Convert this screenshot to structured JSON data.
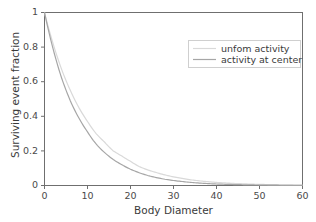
{
  "chart_data": {
    "type": "line",
    "title": "",
    "xlabel": "Body Diameter",
    "ylabel": "Surviving event fraction",
    "xlim": [
      0,
      60
    ],
    "ylim": [
      0,
      1
    ],
    "grid": false,
    "legend_position": "upper right",
    "xticks": [
      0,
      10,
      20,
      30,
      40,
      50,
      60
    ],
    "xtick_labels": [
      "0",
      "10",
      "20",
      "30",
      "40",
      "50",
      "60"
    ],
    "yticks": [
      0,
      0.2,
      0.4,
      0.6,
      0.8,
      1
    ],
    "ytick_labels": [
      "0",
      "0.2",
      "0.4",
      "0.6",
      "0.8",
      "1"
    ],
    "x": [
      0,
      2,
      4,
      6,
      8,
      10,
      12,
      14,
      16,
      18,
      20,
      22,
      24,
      26,
      28,
      30,
      32,
      34,
      36,
      38,
      40,
      42,
      44,
      46,
      48,
      50,
      52,
      54,
      56,
      58,
      60
    ],
    "series": [
      {
        "name": "unfom activity",
        "color": "#d9d9d9",
        "values": [
          1.0,
          0.82,
          0.67,
          0.55,
          0.45,
          0.37,
          0.3,
          0.25,
          0.2,
          0.17,
          0.14,
          0.11,
          0.09,
          0.075,
          0.061,
          0.05,
          0.041,
          0.033,
          0.027,
          0.022,
          0.018,
          0.015,
          0.012,
          0.01,
          0.008,
          0.0067,
          0.0055,
          0.0045,
          0.0037,
          0.003,
          0.0025
        ]
      },
      {
        "name": "activity at center",
        "color": "#a6a6a6",
        "values": [
          1.0,
          0.79,
          0.62,
          0.49,
          0.39,
          0.31,
          0.24,
          0.19,
          0.15,
          0.12,
          0.094,
          0.074,
          0.058,
          0.046,
          0.036,
          0.029,
          0.023,
          0.018,
          0.014,
          0.011,
          0.0088,
          0.0069,
          0.0055,
          0.0043,
          0.0034,
          0.0027,
          0.0021,
          0.0017,
          0.0013,
          0.001,
          0.0008
        ]
      }
    ]
  },
  "axes": {
    "xlabel": "Body Diameter",
    "ylabel": "Surviving event fraction",
    "xtick_labels": [
      "0",
      "10",
      "20",
      "30",
      "40",
      "50",
      "60"
    ],
    "ytick_labels": [
      "1",
      "0.8",
      "0.6",
      "0.4",
      "0.2",
      "0"
    ]
  },
  "legend": {
    "entries": [
      {
        "label": "unfom activity",
        "color": "#d9d9d9"
      },
      {
        "label": "activity at center",
        "color": "#a6a6a6"
      }
    ]
  },
  "colors": {
    "axis": "#6f6f6f",
    "text": "#3a3a3a",
    "background": "#ffffff",
    "legend_border": "#cfcfcf"
  }
}
